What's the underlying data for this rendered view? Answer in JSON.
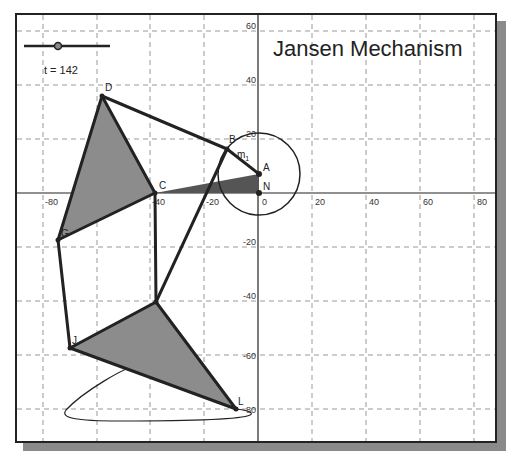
{
  "title": "Jansen Mechanism",
  "slider": {
    "label": "t = 142",
    "value": 142,
    "name": "t"
  },
  "axes": {
    "x_ticks": [
      "-80",
      "-60",
      "-40",
      "-20",
      "0",
      "20",
      "40",
      "60",
      "80"
    ],
    "y_ticks": [
      "60",
      "40",
      "20",
      "0",
      "-20",
      "-40",
      "-60",
      "-80"
    ]
  },
  "points": {
    "A": "A",
    "B": "B",
    "C": "C",
    "D": "D",
    "G": "G",
    "J": "J",
    "L": "L",
    "N": "N",
    "m1": "m"
  },
  "colors": {
    "link": "#222222",
    "triangle_fill": "#8c8c8c",
    "crank_triangle_fill": "#555555",
    "grid": "#999999"
  }
}
